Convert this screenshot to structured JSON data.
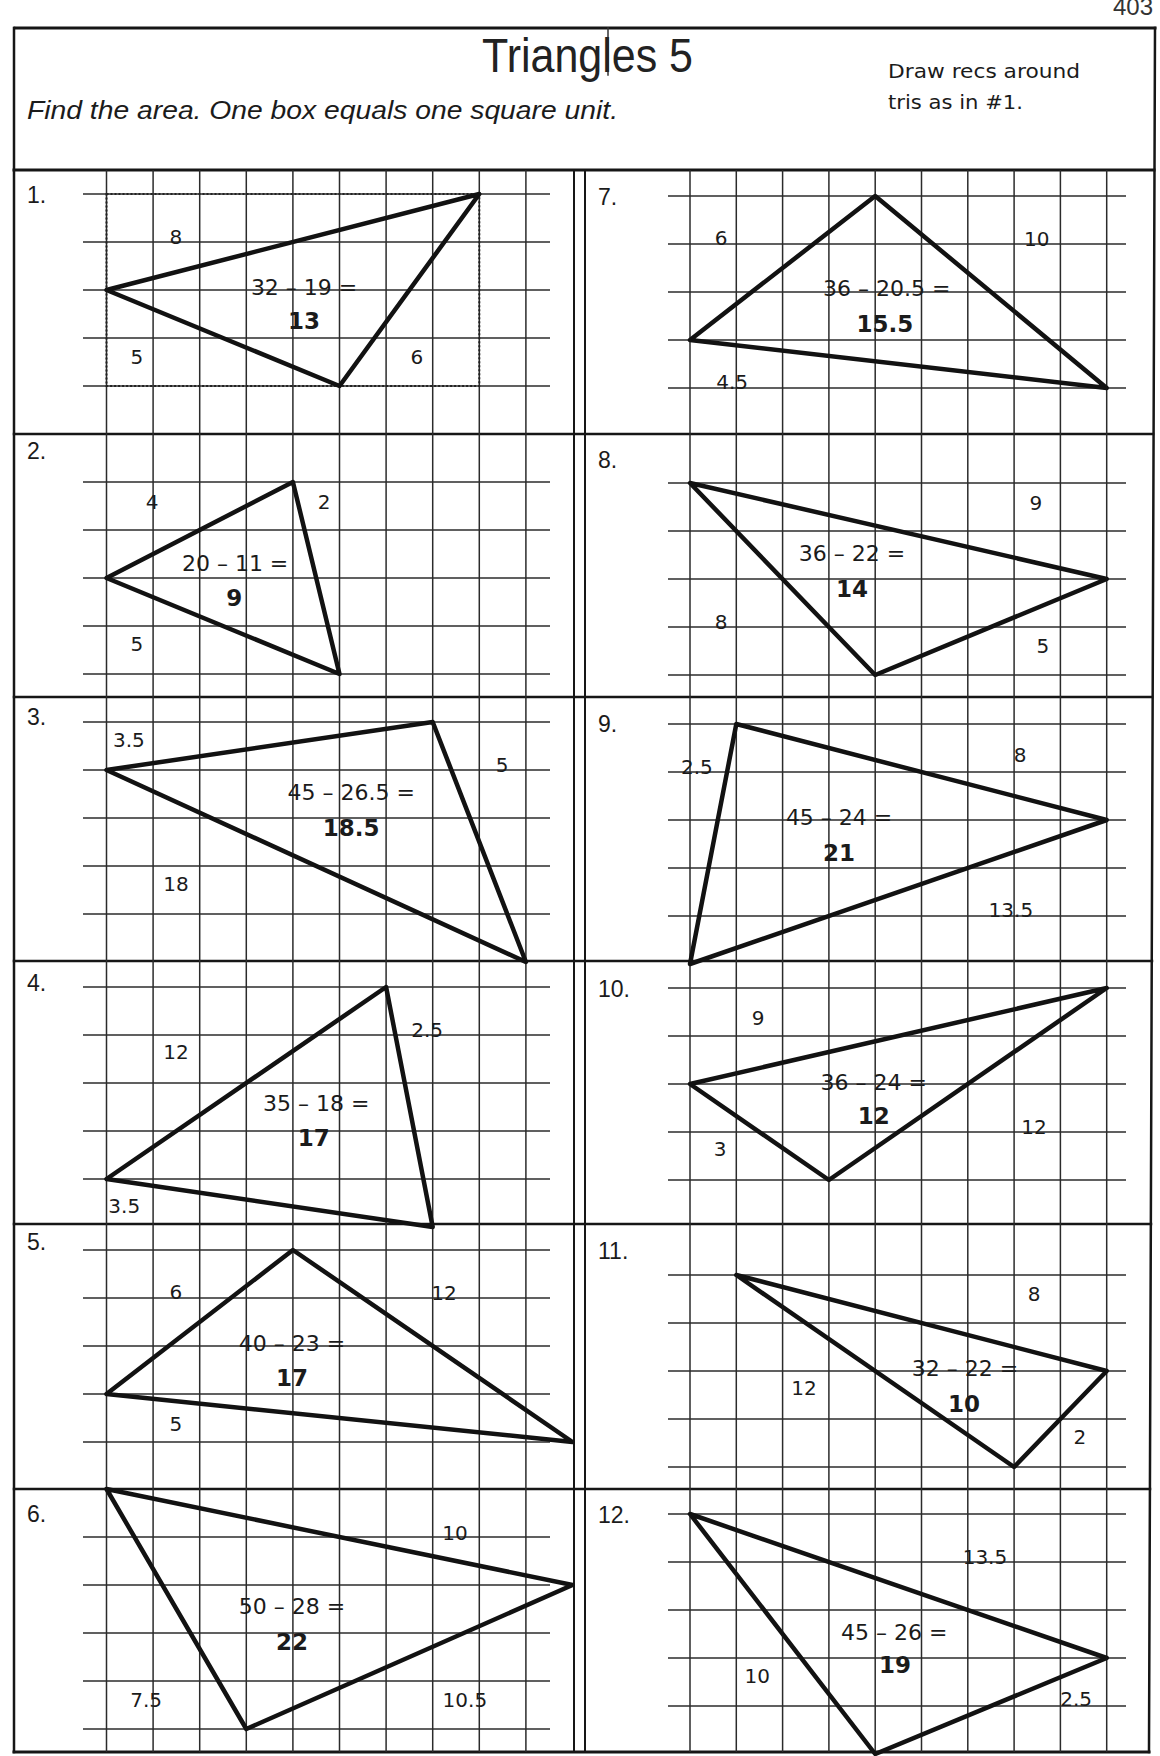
{
  "page": {
    "number": "403"
  },
  "header": {
    "title": "Triangles 5",
    "instructions": "Find the area. One box equals one square unit.",
    "hint": [
      "Draw recs around",
      "tris as in #1."
    ]
  },
  "problems": [
    {
      "number": "1.",
      "vertices": [
        [
          0,
          2
        ],
        [
          8,
          0
        ],
        [
          5,
          4
        ]
      ],
      "bounding_rect": [
        0,
        0,
        8,
        4
      ],
      "side_labels": [
        {
          "text": "8",
          "at": [
            1.49,
            0.9
          ]
        },
        {
          "text": "5",
          "at": [
            0.65,
            3.4
          ]
        },
        {
          "text": "6",
          "at": [
            6.66,
            3.4
          ]
        }
      ],
      "expression": {
        "text": "32 – 19 =",
        "at": [
          4.24,
          1.94
        ]
      },
      "answer": {
        "text": "13",
        "at": [
          4.24,
          2.63
        ]
      }
    },
    {
      "number": "2.",
      "vertices": [
        [
          0,
          2
        ],
        [
          4,
          0
        ],
        [
          5,
          4
        ]
      ],
      "side_labels": [
        {
          "text": "4",
          "at": [
            0.98,
            0.42
          ]
        },
        {
          "text": "2",
          "at": [
            4.67,
            0.42
          ]
        },
        {
          "text": "5",
          "at": [
            0.65,
            3.375
          ]
        }
      ],
      "expression": {
        "text": "20 – 11 =",
        "at": [
          2.76,
          1.69
        ]
      },
      "answer": {
        "text": "9",
        "at": [
          2.74,
          2.4
        ]
      }
    },
    {
      "number": "3.",
      "vertices": [
        [
          0,
          1
        ],
        [
          7,
          0
        ],
        [
          9,
          5
        ]
      ],
      "side_labels": [
        {
          "text": "3.5",
          "at": [
            0.48,
            0.38
          ]
        },
        {
          "text": "5",
          "at": [
            8.49,
            0.9
          ]
        },
        {
          "text": "18",
          "at": [
            1.49,
            3.375
          ]
        }
      ],
      "expression": {
        "text": "45 – 26.5 =",
        "at": [
          5.25,
          1.46
        ]
      },
      "answer": {
        "text": "18.5",
        "at": [
          5.25,
          2.19
        ]
      }
    },
    {
      "number": "4.",
      "vertices": [
        [
          6,
          0
        ],
        [
          0,
          4
        ],
        [
          7,
          5
        ]
      ],
      "side_labels": [
        {
          "text": "12",
          "at": [
            1.49,
            1.35
          ]
        },
        {
          "text": "2.5",
          "at": [
            6.88,
            0.9
          ]
        },
        {
          "text": "3.5",
          "at": [
            0.38,
            4.55
          ]
        }
      ],
      "expression": {
        "text": "35 – 18 =",
        "at": [
          4.5,
          2.42
        ]
      },
      "answer": {
        "text": "17",
        "at": [
          4.45,
          3.125
        ]
      }
    },
    {
      "number": "5.",
      "vertices": [
        [
          4,
          0
        ],
        [
          0,
          3
        ],
        [
          10,
          4
        ]
      ],
      "side_labels": [
        {
          "text": "6",
          "at": [
            1.49,
            0.875
          ]
        },
        {
          "text": "12",
          "at": [
            7.24,
            0.9
          ]
        },
        {
          "text": "5",
          "at": [
            1.49,
            3.625
          ]
        }
      ],
      "expression": {
        "text": "40 – 23 =",
        "at": [
          3.98,
          1.94
        ]
      },
      "answer": {
        "text": "17",
        "at": [
          3.98,
          2.65
        ]
      }
    },
    {
      "number": "6.",
      "vertices": [
        [
          0,
          -1
        ],
        [
          10,
          1
        ],
        [
          3,
          4
        ]
      ],
      "side_labels": [
        {
          "text": "10",
          "at": [
            7.48,
            -0.08
          ]
        },
        {
          "text": "7.5",
          "at": [
            0.85,
            3.4
          ]
        },
        {
          "text": "10.5",
          "at": [
            7.69,
            3.4
          ]
        }
      ],
      "expression": {
        "text": "50 – 28 =",
        "at": [
          3.98,
          1.44
        ]
      },
      "answer": {
        "text": "22",
        "at": [
          3.98,
          2.17
        ]
      }
    },
    {
      "number": "7.",
      "vertices": [
        [
          4,
          0
        ],
        [
          0,
          3
        ],
        [
          9,
          4
        ]
      ],
      "side_labels": [
        {
          "text": "6",
          "at": [
            0.67,
            0.875
          ]
        },
        {
          "text": "10",
          "at": [
            7.49,
            0.9
          ]
        },
        {
          "text": "4.5",
          "at": [
            0.91,
            3.875
          ]
        }
      ],
      "expression": {
        "text": "36 – 20.5 =",
        "at": [
          4.25,
          1.92
        ]
      },
      "answer": {
        "text": "15.5",
        "at": [
          4.21,
          2.65
        ]
      }
    },
    {
      "number": "8.",
      "vertices": [
        [
          0,
          0
        ],
        [
          9,
          2
        ],
        [
          4,
          4
        ]
      ],
      "side_labels": [
        {
          "text": "9",
          "at": [
            7.47,
            0.42
          ]
        },
        {
          "text": "8",
          "at": [
            0.67,
            2.9
          ]
        },
        {
          "text": "5",
          "at": [
            7.62,
            3.4
          ]
        }
      ],
      "expression": {
        "text": "36 – 22 =",
        "at": [
          3.5,
          1.46
        ]
      },
      "answer": {
        "text": "14",
        "at": [
          3.5,
          2.2
        ]
      }
    },
    {
      "number": "9.",
      "vertices": [
        [
          1,
          0
        ],
        [
          9,
          2
        ],
        [
          0,
          5
        ]
      ],
      "side_labels": [
        {
          "text": "2.5",
          "at": [
            0.15,
            0.9
          ]
        },
        {
          "text": "8",
          "at": [
            7.13,
            0.65
          ]
        },
        {
          "text": "13.5",
          "at": [
            6.93,
            3.875
          ]
        }
      ],
      "expression": {
        "text": "45 – 24 =",
        "at": [
          3.22,
          1.94
        ]
      },
      "answer": {
        "text": "21",
        "at": [
          3.22,
          2.67
        ]
      }
    },
    {
      "number": "10.",
      "vertices": [
        [
          9,
          0
        ],
        [
          0,
          2
        ],
        [
          3,
          4
        ]
      ],
      "side_labels": [
        {
          "text": "9",
          "at": [
            1.47,
            0.625
          ]
        },
        {
          "text": "3",
          "at": [
            0.65,
            3.35
          ]
        },
        {
          "text": "12",
          "at": [
            7.43,
            2.9
          ]
        }
      ],
      "expression": {
        "text": "36 – 24 =",
        "at": [
          3.97,
          1.96
        ]
      },
      "answer": {
        "text": "12",
        "at": [
          3.97,
          2.65
        ]
      }
    },
    {
      "number": "11.",
      "vertices": [
        [
          1,
          0
        ],
        [
          9,
          2
        ],
        [
          7,
          4
        ]
      ],
      "side_labels": [
        {
          "text": "8",
          "at": [
            7.43,
            0.4
          ]
        },
        {
          "text": "12",
          "at": [
            2.46,
            2.35
          ]
        },
        {
          "text": "2",
          "at": [
            8.42,
            3.375
          ]
        }
      ],
      "expression": {
        "text": "32 – 22 =",
        "at": [
          5.94,
          1.94
        ]
      },
      "answer": {
        "text": "10",
        "at": [
          5.92,
          2.67
        ]
      }
    },
    {
      "number": "12.",
      "vertices": [
        [
          0,
          0
        ],
        [
          9,
          3
        ],
        [
          4,
          5
        ]
      ],
      "side_labels": [
        {
          "text": "13.5",
          "at": [
            6.37,
            0.9
          ]
        },
        {
          "text": "10",
          "at": [
            1.45,
            3.375
          ]
        },
        {
          "text": "2.5",
          "at": [
            8.34,
            3.85
          ]
        }
      ],
      "expression": {
        "text": "45 – 26 =",
        "at": [
          4.41,
          2.46
        ]
      },
      "answer": {
        "text": "19",
        "at": [
          4.43,
          3.14
        ]
      }
    }
  ]
}
